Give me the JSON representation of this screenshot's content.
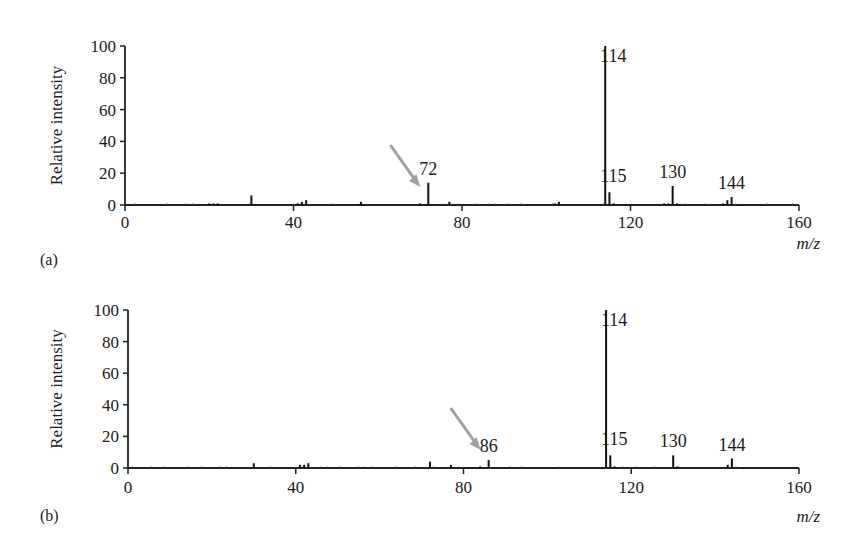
{
  "figure": {
    "panels": [
      {
        "label": "(a)",
        "ylabel": "Relative intensity",
        "xlabel": "m/z",
        "yticks": [
          "0",
          "20",
          "40",
          "60",
          "80",
          "100"
        ],
        "xticks": [
          "0",
          "40",
          "80",
          "120",
          "160"
        ],
        "annotations": [
          {
            "text": "72",
            "mz": 72
          },
          {
            "text": "114",
            "mz": 114
          },
          {
            "text": "115",
            "mz": 115
          },
          {
            "text": "130",
            "mz": 130
          },
          {
            "text": "144",
            "mz": 144
          }
        ],
        "arrow_target": 72
      },
      {
        "label": "(b)",
        "ylabel": "Relative intensity",
        "xlabel": "m/z",
        "yticks": [
          "0",
          "20",
          "40",
          "60",
          "80",
          "100"
        ],
        "xticks": [
          "0",
          "40",
          "80",
          "120",
          "160"
        ],
        "annotations": [
          {
            "text": "86",
            "mz": 86
          },
          {
            "text": "114",
            "mz": 114
          },
          {
            "text": "115",
            "mz": 115
          },
          {
            "text": "130",
            "mz": 130
          },
          {
            "text": "144",
            "mz": 144
          }
        ],
        "arrow_target": 86
      }
    ],
    "arrow_color": "#a0a0a0"
  },
  "chart_data": [
    {
      "type": "bar",
      "title": "(a)",
      "xlabel": "m/z",
      "ylabel": "Relative intensity",
      "xlim": [
        0,
        160
      ],
      "ylim": [
        0,
        100
      ],
      "grid": false,
      "x": [
        20,
        21,
        22,
        30,
        41,
        42,
        43,
        56,
        70,
        72,
        77,
        102,
        103,
        114,
        115,
        116,
        128,
        129,
        130,
        131,
        142,
        143,
        144
      ],
      "values": [
        1,
        1,
        1,
        6,
        1,
        2,
        3,
        2,
        1,
        14,
        2,
        1,
        2,
        100,
        8,
        1,
        1,
        1,
        12,
        1,
        1,
        3,
        5
      ]
    },
    {
      "type": "bar",
      "title": "(b)",
      "xlabel": "m/z",
      "ylabel": "Relative intensity",
      "xlim": [
        0,
        160
      ],
      "ylim": [
        0,
        100
      ],
      "grid": false,
      "x": [
        30,
        41,
        42,
        43,
        72,
        77,
        84,
        86,
        114,
        115,
        116,
        130,
        131,
        143,
        144
      ],
      "values": [
        3,
        2,
        2,
        3,
        4,
        2,
        1,
        5,
        100,
        8,
        1,
        8,
        1,
        2,
        6
      ]
    }
  ]
}
